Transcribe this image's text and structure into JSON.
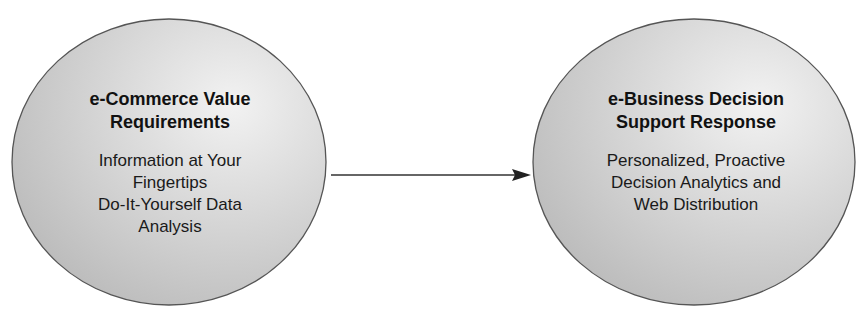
{
  "diagram": {
    "nodes": [
      {
        "id": "left",
        "title_lines": [
          "e-Commerce Value",
          "Requirements"
        ],
        "body_lines": [
          "Information at Your",
          "Fingertips",
          "Do-It-Yourself Data",
          "Analysis"
        ]
      },
      {
        "id": "right",
        "title_lines": [
          "e-Business Decision",
          "Support Response"
        ],
        "body_lines": [
          "Personalized, Proactive",
          "Decision Analytics and",
          "Web Distribution"
        ]
      }
    ],
    "edges": [
      {
        "from": "left",
        "to": "right",
        "type": "arrow"
      }
    ],
    "colors": {
      "fill_light": "#efefef",
      "fill_dark": "#b9b9b9",
      "stroke": "#555555",
      "arrow": "#333333"
    }
  }
}
